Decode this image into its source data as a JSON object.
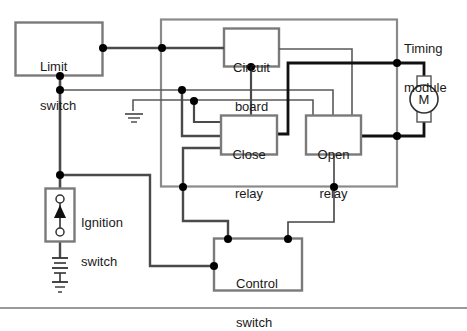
{
  "diagram": {
    "components": {
      "limit_switch": {
        "line1": "Limit",
        "line2": "switch"
      },
      "timing_module": {
        "line1": "Timing",
        "line2": "module"
      },
      "circuit_board": {
        "line1": "Circuit",
        "line2": "board"
      },
      "close_relay": {
        "line1": "Close",
        "line2": "relay"
      },
      "open_relay": {
        "line1": "Open",
        "line2": "relay"
      },
      "motor": {
        "label": "M"
      },
      "ignition_switch": {
        "line1": "Ignition",
        "line2": "switch"
      },
      "control_switch": {
        "line1": "Control",
        "line2": "switch"
      }
    },
    "colors": {
      "box_stroke": "#7a7a7a",
      "wire_gray": "#6e6e6e",
      "wire_dark": "#4a4a4a",
      "wire_black": "#111111",
      "junction": "#000000",
      "separator": "#9a9a9a"
    }
  }
}
